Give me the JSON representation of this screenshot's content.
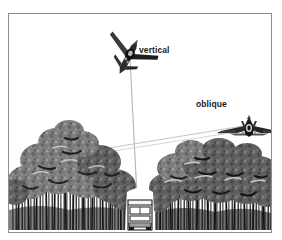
{
  "page": {
    "clipped_heading": "sensor look a",
    "background_color": "#ffffff"
  },
  "figure": {
    "frame_color": "#8d8d8d",
    "labels": {
      "vertical": "vertical",
      "oblique": "oblique"
    },
    "colors": {
      "sightline": "#b0b0b0",
      "canopy_light": "#9a9a9a",
      "canopy_mid": "#6f6f6f",
      "canopy_dark": "#3a3a3a",
      "trunk": "#1c1c1c",
      "aircraft": "#2a2a2a",
      "vehicle_body": "#f2f2f2",
      "vehicle_outline": "#1f1f1f"
    },
    "elements": [
      {
        "name": "vertical-aircraft",
        "label": "vertical",
        "x": 120,
        "y": 42,
        "orientation": "nose-down-diagonal"
      },
      {
        "name": "oblique-aircraft",
        "label": "oblique",
        "x": 240,
        "y": 112,
        "orientation": "delta-wing-rear-view"
      },
      {
        "name": "ground-vehicle",
        "label": "",
        "x": 131,
        "y": 210,
        "orientation": "front-view"
      }
    ],
    "sight_lines": [
      {
        "name": "vertical-sight-line",
        "from": "vertical-aircraft",
        "to": "ground-vehicle",
        "x1": 121,
        "y1": 46,
        "x2": 129,
        "y2": 200
      },
      {
        "name": "oblique-sight-line",
        "from": "oblique-aircraft",
        "to": "tree-canopy-left",
        "x1": 245,
        "y1": 112,
        "x2": 78,
        "y2": 137
      }
    ]
  }
}
